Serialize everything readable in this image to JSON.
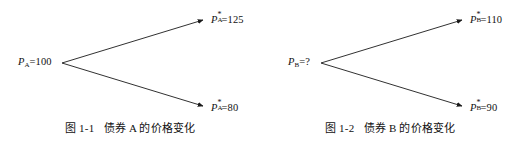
{
  "page": {
    "background_color": "#ffffff",
    "line_color": "#1a1a1a"
  },
  "figures": [
    {
      "id": "figure-1-1",
      "caption_number": "图 1-1",
      "caption_text": "债券 A 的价格变化",
      "root": {
        "symbol": "P",
        "subscript": "A",
        "superscript": "",
        "equals": "=",
        "value": "100",
        "text": "P_A=100"
      },
      "branches": [
        {
          "direction": "up",
          "symbol": "P",
          "subscript": "A",
          "superscript": "*",
          "equals": "=",
          "value": "125",
          "text": "P*_A=125"
        },
        {
          "direction": "down",
          "symbol": "P",
          "subscript": "A",
          "superscript": "*",
          "equals": "=",
          "value": "80",
          "text": "P*_A=80"
        }
      ]
    },
    {
      "id": "figure-1-2",
      "caption_number": "图 1-2",
      "caption_text": "债券 B 的价格变化",
      "root": {
        "symbol": "P",
        "subscript": "B",
        "superscript": "",
        "equals": "=",
        "value": "?",
        "text": "P_B=?"
      },
      "branches": [
        {
          "direction": "up",
          "symbol": "P",
          "subscript": "B",
          "superscript": "*",
          "equals": "=",
          "value": "110",
          "text": "P*_B=110"
        },
        {
          "direction": "down",
          "symbol": "P",
          "subscript": "B",
          "superscript": "*",
          "equals": "=",
          "value": "90",
          "text": "P*_B=90"
        }
      ]
    }
  ]
}
